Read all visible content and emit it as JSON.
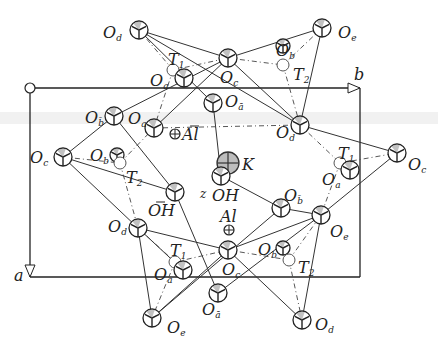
{
  "diagram": {
    "type": "crystal-structure-projection",
    "axes": {
      "b_label": "b",
      "a_label": "a",
      "z_label": "z"
    },
    "cell": {
      "origin": [
        30,
        88
      ],
      "b_end": [
        360,
        88
      ],
      "a_end": [
        30,
        277
      ]
    },
    "atoms": [
      {
        "id": "Od_top_left",
        "label": "O",
        "sub": "d",
        "x": 139,
        "y": 30,
        "kind": "O",
        "lx": 103,
        "ly": 38
      },
      {
        "id": "Oe_top_right",
        "label": "O",
        "sub": "e",
        "x": 322,
        "y": 28,
        "kind": "O",
        "lx": 338,
        "ly": 38
      },
      {
        "id": "Oc_top",
        "label": "O",
        "sub": "c",
        "x": 228,
        "y": 58,
        "kind": "O",
        "lx": 220,
        "ly": 83
      },
      {
        "id": "Ob_top",
        "label": "O",
        "sub": "b",
        "x": 283,
        "y": 46,
        "kind": "Osmall",
        "lx": 276,
        "ly": 56
      },
      {
        "id": "T2_top",
        "label": "T",
        "sub": "2",
        "x": 283,
        "y": 65,
        "kind": "T",
        "lx": 293,
        "ly": 80
      },
      {
        "id": "T1_top",
        "label": "T",
        "sub": "1",
        "x": 173,
        "y": 70,
        "kind": "T",
        "lx": 168,
        "ly": 65
      },
      {
        "id": "Oa_top",
        "label": "O",
        "sub": "a",
        "x": 184,
        "y": 78,
        "kind": "O",
        "lx": 150,
        "ly": 86
      },
      {
        "id": "Oabar_top",
        "label": "O",
        "sub": "ā",
        "x": 213,
        "y": 103,
        "kind": "O",
        "lx": 225,
        "ly": 107
      },
      {
        "id": "Obbar_left",
        "label": "O",
        "sub": "b̄",
        "x": 114,
        "y": 116,
        "kind": "O",
        "lx": 85,
        "ly": 123
      },
      {
        "id": "Oa_left",
        "label": "O",
        "sub": "a",
        "x": 154,
        "y": 128,
        "kind": "O",
        "lx": 128,
        "ly": 124
      },
      {
        "id": "Albar",
        "label": "Al",
        "sub": "",
        "bar": true,
        "x": 175,
        "y": 134,
        "kind": "Al",
        "lx": 182,
        "ly": 140
      },
      {
        "id": "Od_right",
        "label": "O",
        "sub": "d",
        "x": 300,
        "y": 125,
        "kind": "O",
        "lx": 276,
        "ly": 138
      },
      {
        "id": "Oc_left",
        "label": "O",
        "sub": "c",
        "x": 63,
        "y": 157,
        "kind": "O",
        "lx": 30,
        "ly": 163
      },
      {
        "id": "Ob_left",
        "label": "O",
        "sub": "b",
        "x": 117,
        "y": 155,
        "kind": "Osmall",
        "lx": 90,
        "ly": 161
      },
      {
        "id": "T2_left",
        "label": "T",
        "sub": "2",
        "x": 120,
        "y": 163,
        "kind": "T",
        "lx": 126,
        "ly": 183
      },
      {
        "id": "K",
        "label": "K",
        "sub": "",
        "x": 228,
        "y": 163,
        "kind": "K",
        "lx": 242,
        "ly": 170
      },
      {
        "id": "T1_right",
        "label": "T",
        "sub": "1",
        "x": 340,
        "y": 163,
        "kind": "T",
        "lx": 338,
        "ly": 159
      },
      {
        "id": "Oa_right",
        "label": "O",
        "sub": "a",
        "x": 350,
        "y": 170,
        "kind": "O",
        "lx": 322,
        "ly": 185
      },
      {
        "id": "Oc_right",
        "label": "O",
        "sub": "c",
        "x": 397,
        "y": 153,
        "kind": "O",
        "lx": 408,
        "ly": 170
      },
      {
        "id": "OH",
        "label": "OH",
        "sub": "",
        "x": 221,
        "y": 176,
        "kind": "O",
        "lx": 212,
        "ly": 201
      },
      {
        "id": "OHbar",
        "label": "OH",
        "sub": "",
        "bar": true,
        "x": 175,
        "y": 192,
        "kind": "O",
        "lx": 148,
        "ly": 216
      },
      {
        "id": "Obbar_right",
        "label": "O",
        "sub": "b̄",
        "x": 281,
        "y": 208,
        "kind": "O",
        "lx": 284,
        "ly": 201
      },
      {
        "id": "Al",
        "label": "Al",
        "sub": "",
        "x": 229,
        "y": 230,
        "kind": "Al",
        "lx": 220,
        "ly": 222
      },
      {
        "id": "Od_bottom_left",
        "label": "O",
        "sub": "d",
        "x": 138,
        "y": 228,
        "kind": "O",
        "lx": 108,
        "ly": 232
      },
      {
        "id": "Oe_right",
        "label": "O",
        "sub": "e",
        "x": 321,
        "y": 215,
        "kind": "O",
        "lx": 330,
        "ly": 237
      },
      {
        "id": "T1_bottom",
        "label": "T",
        "sub": "1",
        "x": 175,
        "y": 262,
        "kind": "T",
        "lx": 170,
        "ly": 256
      },
      {
        "id": "Oa_bottom",
        "label": "O",
        "sub": "a",
        "x": 183,
        "y": 270,
        "kind": "O",
        "lx": 154,
        "ly": 280
      },
      {
        "id": "Oc_bottom",
        "label": "O",
        "sub": "c",
        "x": 228,
        "y": 250,
        "kind": "O",
        "lx": 222,
        "ly": 275
      },
      {
        "id": "Ob_bottom",
        "label": "O",
        "sub": "b",
        "x": 283,
        "y": 248,
        "kind": "Osmall",
        "lx": 258,
        "ly": 255
      },
      {
        "id": "T2_bottom",
        "label": "T",
        "sub": "2",
        "x": 289,
        "y": 260,
        "kind": "T",
        "lx": 298,
        "ly": 273
      },
      {
        "id": "Oabar_bottom",
        "label": "O",
        "sub": "ā",
        "x": 218,
        "y": 293,
        "kind": "O",
        "lx": 202,
        "ly": 315
      },
      {
        "id": "Oe_bottom",
        "label": "O",
        "sub": "e",
        "x": 152,
        "y": 318,
        "kind": "O",
        "lx": 167,
        "ly": 333
      },
      {
        "id": "Od_bottom",
        "label": "O",
        "sub": "d",
        "x": 302,
        "y": 320,
        "kind": "O",
        "lx": 315,
        "ly": 330
      }
    ],
    "bonds": [
      [
        "Od_top_left",
        "Oc_top"
      ],
      [
        "Oc_top",
        "Oe_top_right"
      ],
      [
        "Od_top_left",
        "Od_right"
      ],
      [
        "Od_top_left",
        "Oabar_top"
      ],
      [
        "Oe_top_right",
        "Od_right"
      ],
      [
        "Oc_top",
        "Od_right"
      ],
      [
        "Oc_top",
        "Obbar_left"
      ],
      [
        "Oc_top",
        "Oa_left"
      ],
      [
        "Obbar_left",
        "Oc_left"
      ],
      [
        "Oc_left",
        "Od_bottom_left"
      ],
      [
        "Od_bottom_left",
        "Oc_bottom"
      ],
      [
        "Oc_bottom",
        "Oe_right"
      ],
      [
        "Od_right",
        "Oc_right"
      ],
      [
        "Oc_right",
        "Oe_right"
      ],
      [
        "Oe_right",
        "Od_bottom"
      ],
      [
        "Oc_bottom",
        "Od_bottom"
      ],
      [
        "Od_bottom_left",
        "Oe_bottom"
      ],
      [
        "Oe_bottom",
        "Oc_bottom"
      ],
      [
        "Oabar_top",
        "OH"
      ],
      [
        "OH",
        "Obbar_right"
      ],
      [
        "Obbar_right",
        "Oe_right"
      ],
      [
        "OHbar",
        "Oabar_bottom"
      ],
      [
        "Oc_left",
        "OHbar"
      ],
      [
        "Obbar_left",
        "OHbar"
      ],
      [
        "Od_bottom_left",
        "Oa_bottom"
      ],
      [
        "Obbar_right",
        "Oe_bottom"
      ],
      [
        "Oabar_bottom",
        "Oe_right"
      ]
    ],
    "dashes": [
      [
        "Od_top_left",
        "T1_top"
      ],
      [
        "T1_top",
        "Oc_top"
      ],
      [
        "T1_top",
        "Oa_left"
      ],
      [
        "Oc_top",
        "T2_top"
      ],
      [
        "T2_top",
        "Oe_top_right"
      ],
      [
        "T2_top",
        "Od_right"
      ],
      [
        "Oc_left",
        "T2_left"
      ],
      [
        "T2_left",
        "Oa_left"
      ],
      [
        "T2_left",
        "Od_bottom_left"
      ],
      [
        "Od_right",
        "T1_right"
      ],
      [
        "T1_right",
        "Oc_right"
      ],
      [
        "T1_right",
        "Oe_right"
      ],
      [
        "Od_bottom_left",
        "T1_bottom"
      ],
      [
        "T1_bottom",
        "Oc_bottom"
      ],
      [
        "T1_bottom",
        "Oe_bottom"
      ],
      [
        "Oc_bottom",
        "T2_bottom"
      ],
      [
        "T2_bottom",
        "Oe_right"
      ],
      [
        "T2_bottom",
        "Od_bottom"
      ],
      [
        "Od_right",
        "Oa_left"
      ]
    ],
    "z_marker": {
      "label": "z",
      "x": 200,
      "y": 184
    }
  }
}
